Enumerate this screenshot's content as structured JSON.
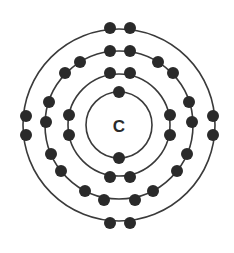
{
  "diagram": {
    "type": "bohr-atom-model",
    "nucleus": {
      "symbol": "C",
      "cx": 119,
      "cy": 125
    },
    "colors": {
      "shell": "#3a3a3a",
      "electron": "#2a2a2a",
      "text": "#2a2a2a",
      "background": "#ffffff"
    },
    "electron_radius": 6,
    "shells": [
      {
        "name": "shell-1",
        "r": 33,
        "electron_count": 2,
        "electrons": [
          [
            119,
            92
          ],
          [
            119,
            158
          ]
        ]
      },
      {
        "name": "shell-2",
        "r": 51,
        "electron_count": 8,
        "electrons": [
          [
            110,
            73
          ],
          [
            130,
            73
          ],
          [
            69,
            115
          ],
          [
            69,
            135
          ],
          [
            170,
            115
          ],
          [
            170,
            135
          ],
          [
            110,
            177
          ],
          [
            130,
            177
          ]
        ]
      },
      {
        "name": "shell-3",
        "r": 74,
        "electron_count": 18,
        "electrons": [
          [
            110,
            51
          ],
          [
            130,
            51
          ],
          [
            80,
            62
          ],
          [
            65,
            73
          ],
          [
            158,
            62
          ],
          [
            173,
            73
          ],
          [
            49,
            102
          ],
          [
            46,
            122
          ],
          [
            189,
            102
          ],
          [
            192,
            122
          ],
          [
            51,
            154
          ],
          [
            61,
            171
          ],
          [
            187,
            154
          ],
          [
            177,
            171
          ],
          [
            85,
            191
          ],
          [
            104,
            200
          ],
          [
            135,
            200
          ],
          [
            153,
            191
          ]
        ]
      },
      {
        "name": "shell-4",
        "r": 96,
        "electron_count": 8,
        "electrons": [
          [
            110,
            28
          ],
          [
            130,
            28
          ],
          [
            26,
            116
          ],
          [
            26,
            135
          ],
          [
            213,
            116
          ],
          [
            213,
            135
          ],
          [
            110,
            223
          ],
          [
            130,
            223
          ]
        ]
      }
    ]
  }
}
